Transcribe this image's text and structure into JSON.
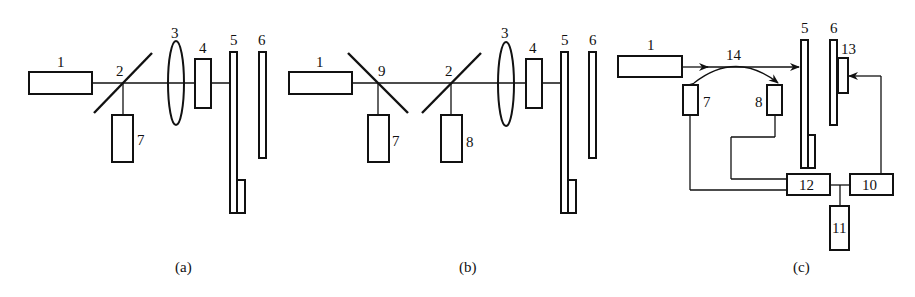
{
  "panels": {
    "a": {
      "caption": "(a)",
      "labels": {
        "l1": "1",
        "l2": "2",
        "l3": "3",
        "l4": "4",
        "l5": "5",
        "l6": "6",
        "l7": "7"
      }
    },
    "b": {
      "caption": "(b)",
      "labels": {
        "l1": "1",
        "l2": "2",
        "l3": "3",
        "l4": "4",
        "l5": "5",
        "l6": "6",
        "l7": "7",
        "l8": "8",
        "l9": "9"
      }
    },
    "c": {
      "caption": "(c)",
      "labels": {
        "l1": "1",
        "l5": "5",
        "l6": "6",
        "l7": "7",
        "l8": "8",
        "l10": "10",
        "l11": "11",
        "l12": "12",
        "l13": "13",
        "l14": "14"
      }
    }
  }
}
